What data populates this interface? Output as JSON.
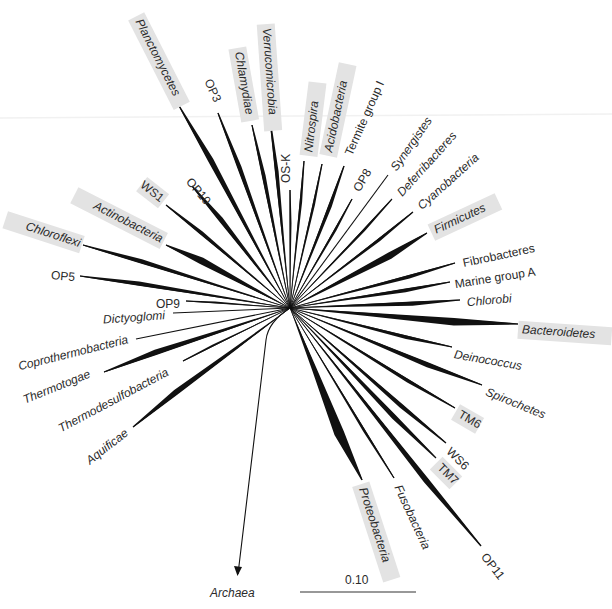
{
  "figure": {
    "type": "unrooted radial phylogenetic tree (Bacteria)",
    "root_label": "Archaea",
    "scale_bar_label": "0.10",
    "highlight_color": "#e3e3e3",
    "branch_color": "#111111"
  },
  "center": [
    290,
    308
  ],
  "taxa": [
    {
      "id": "planctomycetes",
      "label": "Planctomycetes",
      "italic": true,
      "highlight": true,
      "tip": [
        178,
        104
      ],
      "w": 9,
      "lx": 138,
      "ly": 20,
      "rot": 63
    },
    {
      "id": "op3",
      "label": "OP3",
      "italic": false,
      "highlight": false,
      "tip": [
        218,
        113
      ],
      "w": 7,
      "lx": 207,
      "ly": 80,
      "rot": 65
    },
    {
      "id": "chlamydiae",
      "label": "Chlamydiae",
      "italic": true,
      "highlight": true,
      "tip": [
        252,
        125
      ],
      "w": 6,
      "lx": 238,
      "ly": 52,
      "rot": 80
    },
    {
      "id": "verrucomicrobia",
      "label": "Verrucomicrobia",
      "italic": true,
      "highlight": true,
      "tip": [
        270,
        119
      ],
      "w": 6,
      "lx": 266,
      "ly": 28,
      "rot": 86
    },
    {
      "id": "os-k",
      "label": "OS-K",
      "italic": false,
      "highlight": false,
      "tip": [
        290,
        190
      ],
      "w": 3,
      "lx": 287,
      "ly": 183,
      "rot": -90
    },
    {
      "id": "nitrospira",
      "label": "Nitrospira",
      "italic": true,
      "highlight": true,
      "tip": [
        304,
        161
      ],
      "w": 4,
      "lx": 309,
      "ly": 152,
      "rot": -83
    },
    {
      "id": "acidobacteria",
      "label": "Acidobacteria",
      "italic": true,
      "highlight": true,
      "tip": [
        322,
        164
      ],
      "w": 4,
      "lx": 329,
      "ly": 152,
      "rot": -78
    },
    {
      "id": "termite-group-i",
      "label": "Termite group I",
      "italic": false,
      "highlight": false,
      "tip": [
        344,
        166
      ],
      "w": 6,
      "lx": 349,
      "ly": 155,
      "rot": -66
    },
    {
      "id": "op8",
      "label": "OP8",
      "italic": false,
      "highlight": false,
      "tip": [
        352,
        199
      ],
      "w": 4,
      "lx": 357,
      "ly": 191,
      "rot": -60
    },
    {
      "id": "synergistes",
      "label": "Synergistes",
      "italic": true,
      "highlight": false,
      "tip": [
        388,
        175
      ],
      "w": 0,
      "lx": 394,
      "ly": 170,
      "rot": -55
    },
    {
      "id": "deferribacteres",
      "label": "Deferribacteres",
      "italic": true,
      "highlight": false,
      "tip": [
        392,
        199
      ],
      "w": 4,
      "lx": 400,
      "ly": 195,
      "rot": -48
    },
    {
      "id": "cyanobacteria",
      "label": "Cyanobacteria",
      "italic": true,
      "highlight": false,
      "tip": [
        413,
        212
      ],
      "w": 5,
      "lx": 420,
      "ly": 208,
      "rot": -42
    },
    {
      "id": "firmicutes",
      "label": "Firmicutes",
      "italic": true,
      "highlight": true,
      "tip": [
        427,
        233
      ],
      "w": 11,
      "lx": 435,
      "ly": 231,
      "rot": -25
    },
    {
      "id": "fibrobacteres",
      "label": "Fibrobacteres",
      "italic": false,
      "highlight": false,
      "tip": [
        455,
        263
      ],
      "w": 6,
      "lx": 463,
      "ly": 264,
      "rot": -12
    },
    {
      "id": "marine-group-a",
      "label": "Marine group A",
      "italic": false,
      "highlight": false,
      "tip": [
        450,
        282
      ],
      "w": 6,
      "lx": 455,
      "ly": 285,
      "rot": -9
    },
    {
      "id": "chlorobi",
      "label": "Chlorobi",
      "italic": true,
      "highlight": false,
      "tip": [
        460,
        300
      ],
      "w": 7,
      "lx": 467,
      "ly": 303,
      "rot": -5
    },
    {
      "id": "bacteroidetes",
      "label": "Bacteroidetes",
      "italic": true,
      "highlight": true,
      "tip": [
        518,
        324
      ],
      "w": 12,
      "lx": 522,
      "ly": 330,
      "rot": 4
    },
    {
      "id": "deinococcus",
      "label": "Deinococcus",
      "italic": true,
      "highlight": false,
      "tip": [
        452,
        347
      ],
      "w": 6,
      "lx": 454,
      "ly": 355,
      "rot": 10
    },
    {
      "id": "spirochetes",
      "label": "Spirochetes",
      "italic": true,
      "highlight": false,
      "tip": [
        482,
        385
      ],
      "w": 8,
      "lx": 486,
      "ly": 392,
      "rot": 22
    },
    {
      "id": "tm6",
      "label": "TM6",
      "italic": false,
      "highlight": true,
      "tip": [
        455,
        408
      ],
      "w": 6,
      "lx": 459,
      "ly": 414,
      "rot": 30
    },
    {
      "id": "ws6",
      "label": "WS6",
      "italic": false,
      "highlight": false,
      "tip": [
        446,
        443
      ],
      "w": 7,
      "lx": 448,
      "ly": 450,
      "rot": 45
    },
    {
      "id": "tm7",
      "label": "TM7",
      "italic": false,
      "highlight": true,
      "tip": [
        436,
        458
      ],
      "w": 8,
      "lx": 439,
      "ly": 466,
      "rot": 45
    },
    {
      "id": "op11",
      "label": "OP11",
      "italic": false,
      "highlight": false,
      "tip": [
        481,
        546
      ],
      "w": 9,
      "lx": 483,
      "ly": 555,
      "rot": 52
    },
    {
      "id": "fusobacteria",
      "label": "Fusobacteria",
      "italic": true,
      "highlight": false,
      "tip": [
        394,
        478
      ],
      "w": 4,
      "lx": 397,
      "ly": 486,
      "rot": 65
    },
    {
      "id": "proteobacteria",
      "label": "Proteobacteria",
      "italic": true,
      "highlight": true,
      "tip": [
        362,
        480
      ],
      "w": 16,
      "lx": 362,
      "ly": 488,
      "rot": 72
    },
    {
      "id": "aquificae",
      "label": "Aquificae",
      "italic": true,
      "highlight": false,
      "tip": [
        133,
        427
      ],
      "w": 9,
      "lx": 127,
      "ly": 432,
      "rot": -38
    },
    {
      "id": "thermodesulfobacteria",
      "label": "Thermodesulfobacteria",
      "italic": true,
      "highlight": false,
      "tip": [
        183,
        361
      ],
      "w": 3,
      "lx": 168,
      "ly": 372,
      "rot": -28
    },
    {
      "id": "thermotogae",
      "label": "Thermotogae",
      "italic": true,
      "highlight": false,
      "tip": [
        104,
        372
      ],
      "w": 9,
      "lx": 90,
      "ly": 374,
      "rot": -22
    },
    {
      "id": "coprothermobacteria",
      "label": "Coprothermobacteria",
      "italic": true,
      "highlight": false,
      "tip": [
        136,
        339
      ],
      "w": 1,
      "lx": 128,
      "ly": 340,
      "rot": -14
    },
    {
      "id": "dictyoglomi",
      "label": "Dictyoglomi",
      "italic": true,
      "highlight": false,
      "tip": [
        173,
        313
      ],
      "w": 1,
      "lx": 165,
      "ly": 316,
      "rot": -4
    },
    {
      "id": "op9",
      "label": "OP9",
      "italic": false,
      "highlight": false,
      "tip": [
        186,
        301
      ],
      "w": 3,
      "lx": 180,
      "ly": 305,
      "rot": 0
    },
    {
      "id": "op5",
      "label": "OP5",
      "italic": false,
      "highlight": false,
      "tip": [
        80,
        276
      ],
      "w": 7,
      "lx": 75,
      "ly": 278,
      "rot": 5
    },
    {
      "id": "chloroflexi",
      "label": "Chloroflexi",
      "italic": true,
      "highlight": true,
      "tip": [
        83,
        245
      ],
      "w": 7,
      "lx": 80,
      "ly": 244,
      "rot": 18
    },
    {
      "id": "actinobacteria",
      "label": "Actinobacteria",
      "italic": true,
      "highlight": true,
      "tip": [
        166,
        245
      ],
      "w": 11,
      "lx": 162,
      "ly": 240,
      "rot": 27
    },
    {
      "id": "ws1",
      "label": "WS1",
      "italic": false,
      "highlight": true,
      "tip": [
        166,
        205
      ],
      "w": 6,
      "lx": 162,
      "ly": 200,
      "rot": 38
    },
    {
      "id": "op10",
      "label": "OP10",
      "italic": false,
      "highlight": false,
      "tip": [
        192,
        186
      ],
      "w": 8,
      "lx": 188,
      "ly": 180,
      "rot": 50
    }
  ],
  "root_branch": {
    "from": [
      290,
      308
    ],
    "via": [
      268,
      322
    ],
    "to": [
      238,
      574
    ]
  },
  "scale_bar": {
    "x1": 300,
    "x2": 416,
    "y": 592
  }
}
